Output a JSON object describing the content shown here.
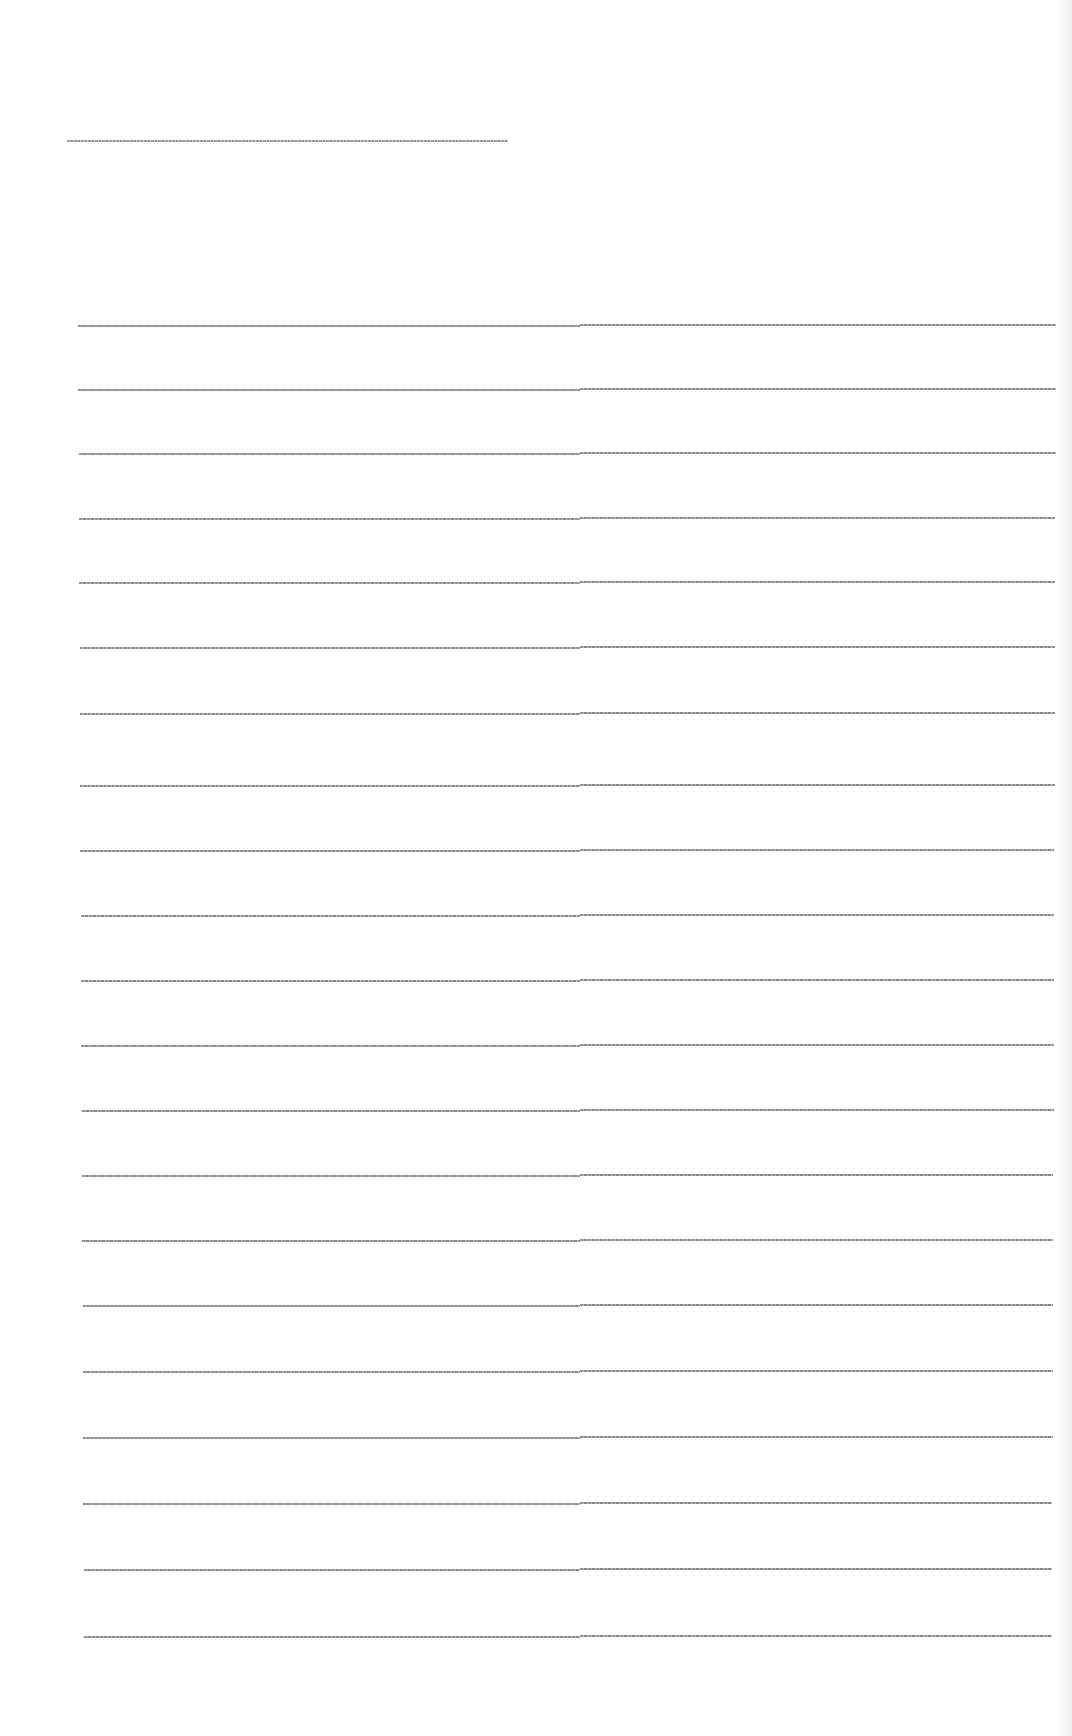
{
  "document": {
    "type": "ruled-paper-sheet",
    "background_color": "#ffffff",
    "line_color": "#7d7d7d",
    "header_line": {
      "x_start": 67,
      "x_end": 508,
      "y": 140
    },
    "ruled_lines": {
      "count": 21,
      "x_start": 78,
      "x_end": 1056,
      "midpoint_step_x": 580,
      "y_positions": [
        325,
        389,
        453,
        518,
        582,
        647,
        713,
        785,
        850,
        915,
        980,
        1045,
        1110,
        1175,
        1240,
        1305,
        1371,
        1437,
        1503,
        1569,
        1636
      ]
    }
  }
}
